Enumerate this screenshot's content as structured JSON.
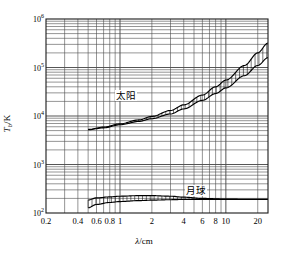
{
  "figure": {
    "background_color": "#ffffff",
    "axis_color": "#1a1a1a",
    "grid_color": "#4d4d4d",
    "curve_color": "#000000"
  },
  "axes": {
    "x_title": "λ/cm",
    "x_title_italic_part": "λ",
    "x_title_rest": "/cm",
    "y_title_main": "T",
    "y_title_sub": "b",
    "y_title_rest": "/K",
    "x_ticks": [
      {
        "value": 0.2,
        "label": "0.2",
        "px": 46
      },
      {
        "value": 0.4,
        "label": "0.4",
        "px": 89
      },
      {
        "value": 0.6,
        "label": "0.6",
        "px": 107
      },
      {
        "value": 0.8,
        "label": "0.8",
        "px": 120
      },
      {
        "value": 1.0,
        "label": "1",
        "px": 130
      },
      {
        "value": 2.0,
        "label": "2",
        "px": 163
      },
      {
        "value": 4.0,
        "label": "4",
        "px": 196
      },
      {
        "value": 6.0,
        "label": "6",
        "px": 215
      },
      {
        "value": 8.0,
        "label": "8",
        "px": 229
      },
      {
        "value": 10.0,
        "label": "10",
        "px": 239
      },
      {
        "value": 20.0,
        "label": "20",
        "px": 261
      }
    ],
    "y_ticks": [
      {
        "value": 100,
        "label": "10",
        "exp": "2",
        "px": 213
      },
      {
        "value": 1000,
        "label": "10",
        "exp": "3",
        "px": 164
      },
      {
        "value": 10000,
        "label": "10",
        "exp": "4",
        "px": 116
      },
      {
        "value": 100000,
        "label": "10",
        "exp": "5",
        "px": 67
      },
      {
        "value": 1000000,
        "label": "10",
        "exp": "6",
        "px": 19
      }
    ]
  },
  "chart_data": {
    "type": "line",
    "title": "",
    "xlabel": "λ/cm",
    "ylabel": "T_b/K",
    "xscale": "log",
    "yscale": "log",
    "xlim": [
      0.2,
      25
    ],
    "ylim": [
      100,
      1000000
    ],
    "grid": true,
    "legend": "inline-annotations",
    "annotations": [
      {
        "text": "太阳",
        "meaning": "Sun",
        "x": 1.15,
        "y": 26000
      },
      {
        "text": "月球",
        "meaning": "Moon",
        "x": 5.2,
        "y": 290
      }
    ],
    "series": [
      {
        "name": "太阳",
        "name_en": "Sun",
        "style": "hatched-band",
        "x": [
          0.5,
          0.7,
          1.0,
          1.5,
          2.0,
          3.0,
          4.0,
          6.0,
          8.0,
          10.0,
          15.0,
          20.0,
          25.0
        ],
        "upper": [
          5300,
          5900,
          6900,
          8300,
          9800,
          13000,
          17000,
          27000,
          40000,
          55000,
          110000,
          200000,
          320000
        ],
        "lower": [
          5200,
          5700,
          6600,
          7700,
          8800,
          11000,
          14000,
          21000,
          29000,
          38000,
          68000,
          110000,
          160000
        ]
      },
      {
        "name": "月球",
        "name_en": "Moon",
        "style": "hatched-band",
        "x": [
          0.5,
          0.6,
          0.8,
          1.0,
          1.5,
          2.0,
          3.0,
          4.0,
          6.0,
          10.0,
          15.0,
          20.0,
          25.0
        ],
        "upper": [
          185,
          205,
          215,
          222,
          228,
          228,
          222,
          212,
          200,
          194,
          192,
          192,
          192
        ],
        "lower": [
          128,
          150,
          165,
          172,
          180,
          184,
          188,
          190,
          191,
          191,
          191,
          191,
          191
        ]
      }
    ]
  }
}
